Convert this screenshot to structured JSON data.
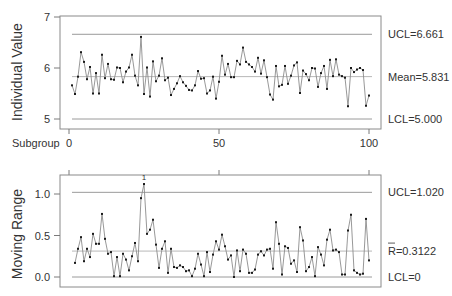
{
  "chart_data": [
    {
      "type": "line",
      "title": "",
      "ylabel": "Individual Value",
      "xlabel": "Subgroup",
      "ylim": [
        4.8,
        7.05
      ],
      "xlim": [
        -2,
        104
      ],
      "yticks": [
        5,
        6,
        7
      ],
      "xticks": [
        0,
        50,
        100
      ],
      "ytick_labels": [
        "5",
        "6",
        "7"
      ],
      "xtick_labels": [
        "0",
        "50",
        "100"
      ],
      "control_lines": [
        {
          "name": "UCL",
          "value": 6.661,
          "label": "UCL=6.661"
        },
        {
          "name": "Mean",
          "value": 5.831,
          "label": "Mean=5.831"
        },
        {
          "name": "LCL",
          "value": 5.0,
          "label": "LCL=5.000"
        }
      ],
      "series": [
        {
          "name": "Individual Value",
          "values": [
            5.66,
            5.49,
            5.83,
            6.31,
            6.12,
            5.78,
            6.02,
            5.5,
            5.9,
            5.5,
            6.26,
            5.8,
            6.08,
            5.78,
            5.77,
            6.01,
            6.0,
            5.72,
            5.93,
            6.01,
            6.26,
            5.85,
            5.66,
            6.61,
            5.49,
            6.01,
            5.44,
            6.13,
            5.74,
            5.85,
            6.19,
            5.76,
            5.81,
            5.47,
            5.59,
            5.7,
            5.84,
            5.72,
            5.65,
            5.57,
            5.56,
            5.66,
            5.94,
            5.79,
            5.8,
            5.5,
            5.56,
            5.83,
            5.4,
            5.73,
            6.24,
            5.87,
            6.08,
            5.82,
            5.82,
            6.14,
            6.07,
            6.4,
            6.12,
            6.07,
            6.02,
            5.93,
            6.2,
            5.89,
            6.15,
            5.82,
            5.48,
            5.38,
            6.04,
            5.64,
            5.67,
            6.04,
            5.69,
            5.85,
            6.05,
            6.11,
            5.51,
            5.95,
            5.88,
            5.76,
            6.0,
            5.99,
            5.63,
            5.9,
            6.04,
            5.59,
            6.16,
            5.84,
            6.17,
            5.87,
            5.84,
            5.81,
            5.25,
            6.0,
            5.92,
            5.97,
            6.0,
            5.96,
            5.26,
            5.46
          ]
        }
      ],
      "grid": false,
      "legend": "none"
    },
    {
      "type": "line",
      "title": "",
      "ylabel": "Moving Range",
      "xlabel": "",
      "ylim": [
        -0.1,
        1.25
      ],
      "xlim": [
        -2,
        104
      ],
      "yticks": [
        0.0,
        0.5,
        1.0
      ],
      "ytick_labels": [
        "0.0",
        "0.5",
        "1.0"
      ],
      "control_lines": [
        {
          "name": "UCL",
          "value": 1.02,
          "label": "UCL=1.020"
        },
        {
          "name": "Rbar",
          "value": 0.3122,
          "label": "R=0.3122"
        },
        {
          "name": "LCL",
          "value": 0,
          "label": "LCL=0"
        }
      ],
      "series": [
        {
          "name": "Moving Range",
          "derived_from": "Individual Value",
          "method": "absolute difference of consecutive values"
        }
      ],
      "annotations": [
        {
          "subgroup": 24,
          "text": "1"
        }
      ],
      "grid": false,
      "legend": "none"
    }
  ]
}
